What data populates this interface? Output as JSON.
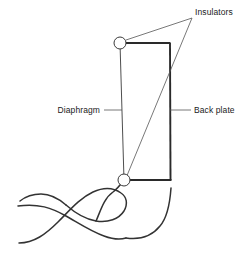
{
  "figure": {
    "title": "",
    "background_color": "#ffffff",
    "width": 246,
    "height": 257
  },
  "labels": {
    "insulators": "Insulators",
    "diaphragm": "Diaphragm",
    "back_plate": "Back plate"
  },
  "colors": {
    "line": "#3a3a3a",
    "plate": "#2a2a2a",
    "leader": "#555555",
    "wire": "#333333",
    "text": "#1a1a1a",
    "insulator_fill": "#ffffff"
  },
  "parts": {
    "diaphragm": {
      "name": "Diaphragm",
      "shape": "vertical-line",
      "x": 120,
      "y_top": 43,
      "y_bottom": 180
    },
    "back_plate": {
      "name": "Back plate",
      "shape": "vertical-line",
      "x": 170,
      "y_top": 43,
      "y_bottom": 180
    },
    "top_edge": {
      "name": "top-edge",
      "from": [
        120,
        43
      ],
      "to": [
        170,
        43
      ]
    },
    "bottom_edge": {
      "name": "bottom-edge",
      "from": [
        124,
        180
      ],
      "to": [
        171,
        180
      ]
    },
    "diagonal": {
      "name": "insulator-diagonal",
      "from": [
        124,
        180
      ],
      "to": [
        192,
        18
      ]
    },
    "insulator_top": {
      "name": "Insulator",
      "cx": 120,
      "cy": 43,
      "r": 6
    },
    "insulator_bottom": {
      "name": "Insulator",
      "cx": 124,
      "cy": 180,
      "r": 6
    }
  },
  "leaders": {
    "insulators_upper": {
      "from": [
        126,
        40
      ],
      "to": [
        192,
        18
      ]
    },
    "insulators_lower": {
      "from": [
        192,
        18
      ],
      "to": [
        128,
        178
      ]
    },
    "diaphragm": {
      "from": [
        110,
        110
      ],
      "to": [
        120,
        110
      ]
    },
    "back_plate": {
      "from": [
        170,
        110
      ],
      "to": [
        190,
        110
      ]
    }
  },
  "wire": {
    "description": "twisted pair of lead wires",
    "left_end_x": 18,
    "right_end_x": 171
  }
}
